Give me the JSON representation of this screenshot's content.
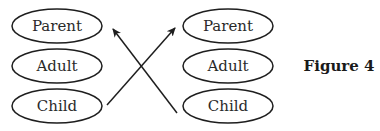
{
  "figure_label": "Figure 4",
  "left_column": {
    "nodes": [
      {
        "label": "Parent"
      },
      {
        "label": "Adult"
      },
      {
        "label": "Child"
      }
    ]
  },
  "right_column": {
    "nodes": [
      {
        "label": "Parent"
      },
      {
        "label": "Adult"
      },
      {
        "label": "Child"
      }
    ]
  },
  "arrows": [
    {
      "from": "left.Child",
      "to": "right.Parent"
    },
    {
      "from": "right.Child",
      "to": "left.Parent"
    }
  ],
  "colors": {
    "stroke": "#1e1e1e",
    "text": "#2a2a2a",
    "background": "#ffffff"
  }
}
